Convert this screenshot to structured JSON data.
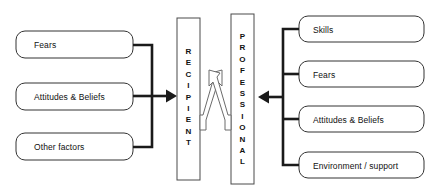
{
  "diagram": {
    "background_color": "#ffffff",
    "stroke_color": "#1a1a1a",
    "text_color": "#111111",
    "left_group": {
      "name": "recipient-factors",
      "boxes": [
        {
          "label": "Fears"
        },
        {
          "label": "Attitudes & Beliefs"
        },
        {
          "label": "Other factors"
        }
      ]
    },
    "right_group": {
      "name": "professional-factors",
      "boxes": [
        {
          "label": "Skills"
        },
        {
          "label": "Fears"
        },
        {
          "label": "Attitudes & Beliefs"
        },
        {
          "label": "Environment / support"
        }
      ]
    },
    "center": {
      "recipient": {
        "label": "RECIPIENT",
        "letters": [
          "R",
          "E",
          "C",
          "I",
          "P",
          "I",
          "E",
          "N",
          "T"
        ]
      },
      "professional": {
        "label": "PROFESSIONAL",
        "letters": [
          "P",
          "R",
          "O",
          "F",
          "E",
          "S",
          "S",
          "I",
          "O",
          "N",
          "A",
          "L"
        ]
      }
    },
    "connectors": {
      "left_arrow": "arrow-right-into-recipient",
      "right_arrow": "arrow-left-into-professional",
      "interaction": "crossed-bidirectional-arrows"
    }
  }
}
